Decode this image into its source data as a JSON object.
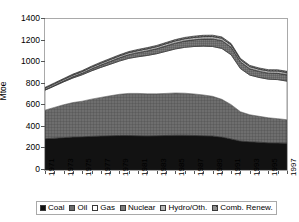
{
  "chart_data": {
    "type": "area",
    "stacked": true,
    "title": "",
    "xlabel": "",
    "ylabel": "Mtoe",
    "ylim": [
      0,
      1400
    ],
    "ytick_step": 200,
    "yticks": [
      0,
      200,
      400,
      600,
      800,
      1000,
      1200,
      1400
    ],
    "grid": false,
    "legend_position": "bottom",
    "x": [
      1971,
      1972,
      1973,
      1974,
      1975,
      1976,
      1977,
      1978,
      1979,
      1980,
      1981,
      1982,
      1983,
      1984,
      1985,
      1986,
      1987,
      1988,
      1989,
      1990,
      1991,
      1992,
      1993,
      1994,
      1995,
      1996,
      1997
    ],
    "xtick_labels": [
      "1971",
      "1973",
      "1975",
      "1977",
      "1979",
      "1981",
      "1983",
      "1985",
      "1987",
      "1989",
      "1991",
      "1993",
      "1995",
      "1997"
    ],
    "series": [
      {
        "name": "Coal",
        "fill": "#121212",
        "pattern": "solid",
        "values": [
          290,
          295,
          300,
          305,
          308,
          312,
          315,
          318,
          320,
          320,
          318,
          316,
          318,
          320,
          322,
          322,
          320,
          318,
          315,
          305,
          288,
          268,
          262,
          258,
          252,
          250,
          248
        ]
      },
      {
        "name": "Oil",
        "fill": "#6e6e6e",
        "pattern": "grid",
        "values": [
          265,
          285,
          305,
          320,
          330,
          345,
          358,
          370,
          382,
          390,
          392,
          390,
          388,
          390,
          392,
          390,
          385,
          378,
          368,
          350,
          318,
          272,
          250,
          240,
          232,
          226,
          218
        ]
      },
      {
        "name": "Gas",
        "fill": "#ffffff",
        "pattern": "none",
        "values": [
          185,
          198,
          212,
          228,
          245,
          262,
          278,
          292,
          308,
          325,
          340,
          356,
          372,
          390,
          408,
          425,
          440,
          452,
          462,
          472,
          462,
          400,
          368,
          360,
          358,
          362,
          358
        ]
      },
      {
        "name": "Nuclear",
        "fill": "#7d7d7d",
        "pattern": "dense-grid",
        "values": [
          4,
          6,
          8,
          11,
          14,
          18,
          22,
          26,
          30,
          34,
          38,
          42,
          46,
          50,
          54,
          58,
          62,
          66,
          70,
          72,
          70,
          62,
          58,
          56,
          56,
          58,
          58
        ]
      },
      {
        "name": "Hydro/Oth.",
        "fill": "#b5b5b5",
        "pattern": "light-grid",
        "values": [
          14,
          15,
          15,
          16,
          16,
          17,
          17,
          18,
          18,
          19,
          19,
          20,
          20,
          21,
          21,
          22,
          22,
          23,
          23,
          23,
          22,
          21,
          21,
          21,
          21,
          22,
          22
        ]
      },
      {
        "name": "Comb. Renew.",
        "fill": "#8f8f8f",
        "pattern": "diag",
        "values": [
          8,
          8,
          8,
          9,
          9,
          9,
          10,
          10,
          10,
          10,
          11,
          11,
          11,
          11,
          12,
          12,
          12,
          12,
          12,
          12,
          12,
          11,
          11,
          11,
          11,
          11,
          11
        ]
      }
    ]
  },
  "legend": {
    "items": [
      {
        "label": "Coal"
      },
      {
        "label": "Oil"
      },
      {
        "label": "Gas"
      },
      {
        "label": "Nuclear"
      },
      {
        "label": "Hydro/Oth."
      },
      {
        "label": "Comb. Renew."
      }
    ]
  }
}
